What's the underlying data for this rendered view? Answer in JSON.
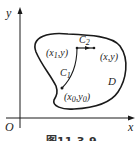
{
  "figure": {
    "caption": "图11-3-9",
    "axes": {
      "x_label": "x",
      "y_label": "y",
      "origin_label": "O"
    },
    "region_label": "D",
    "curves": [
      {
        "name": "C1",
        "base": "C",
        "sub": "1"
      },
      {
        "name": "C2",
        "base": "C",
        "sub": "2"
      }
    ],
    "points": {
      "p1": {
        "open": "(",
        "x": "x",
        "xsub": "1",
        "sep": ",",
        "y": "y",
        "close": ")"
      },
      "p": {
        "text": "(x,y)"
      },
      "p0": {
        "open": "(",
        "x": "x",
        "xsub": "0",
        "sep": ",",
        "y": "y",
        "ysub": "0",
        "close": ")"
      }
    },
    "colors": {
      "stroke": "#1a1a1a",
      "background": "#ffffff"
    }
  }
}
